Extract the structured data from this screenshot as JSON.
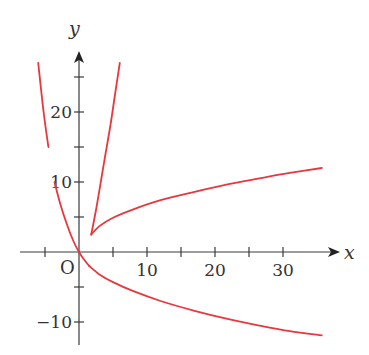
{
  "chart_data": {
    "type": "line",
    "title": "",
    "xlabel": "x",
    "ylabel": "y",
    "origin_label": "O",
    "xlim": [
      -9,
      38
    ],
    "ylim": [
      -13,
      29
    ],
    "grid": false,
    "legend": null,
    "x_ticks": [
      -5,
      0,
      5,
      10,
      15,
      20,
      25,
      30
    ],
    "x_tick_labels": [
      {
        "value": 10,
        "label": "10"
      },
      {
        "value": 20,
        "label": "20"
      },
      {
        "value": 30,
        "label": "30"
      }
    ],
    "y_ticks": [
      -10,
      -5,
      0,
      5,
      10,
      15,
      20,
      25
    ],
    "y_tick_labels": [
      {
        "value": 20,
        "label": "20"
      },
      {
        "value": 10,
        "label": "10"
      },
      {
        "value": -10,
        "label": "−10"
      }
    ],
    "curve_color": "#e8383d",
    "axis_color": "#3a3a3a",
    "series": [
      {
        "name": "left-steep-branch",
        "points": [
          [
            -6.0,
            27.0
          ],
          [
            -5.2,
            20.0
          ],
          [
            -4.5,
            15.0
          ],
          [
            -3.6,
            10.0
          ],
          [
            -2.8,
            7.0
          ],
          [
            -1.8,
            4.0
          ],
          [
            -0.8,
            1.5
          ],
          [
            0.0,
            0.0
          ],
          [
            0.6,
            -0.9
          ],
          [
            1.5,
            -2.0
          ]
        ],
        "gap_near_y": [
          10.0,
          13.0
        ]
      },
      {
        "name": "lower-branch",
        "points": [
          [
            1.5,
            -2.0
          ],
          [
            3.0,
            -3.2
          ],
          [
            5.0,
            -4.3
          ],
          [
            8.0,
            -5.6
          ],
          [
            12.0,
            -7.0
          ],
          [
            17.0,
            -8.4
          ],
          [
            22.0,
            -9.6
          ],
          [
            27.0,
            -10.6
          ],
          [
            31.0,
            -11.3
          ],
          [
            35.7,
            -11.9
          ]
        ]
      },
      {
        "name": "upper-steep-branch",
        "points": [
          [
            1.8,
            2.5
          ],
          [
            2.5,
            6.0
          ],
          [
            3.2,
            10.0
          ],
          [
            3.9,
            14.0
          ],
          [
            4.6,
            18.0
          ],
          [
            5.3,
            22.5
          ],
          [
            6.0,
            27.0
          ]
        ]
      },
      {
        "name": "upper-right-branch",
        "points": [
          [
            1.8,
            2.5
          ],
          [
            3.0,
            3.7
          ],
          [
            5.0,
            4.9
          ],
          [
            8.0,
            6.1
          ],
          [
            12.0,
            7.4
          ],
          [
            17.0,
            8.6
          ],
          [
            22.0,
            9.7
          ],
          [
            27.0,
            10.6
          ],
          [
            31.0,
            11.3
          ],
          [
            35.7,
            12.0
          ]
        ]
      }
    ],
    "annotations": [
      {
        "type": "cusp",
        "x": 1.8,
        "y": 2.5
      }
    ]
  }
}
